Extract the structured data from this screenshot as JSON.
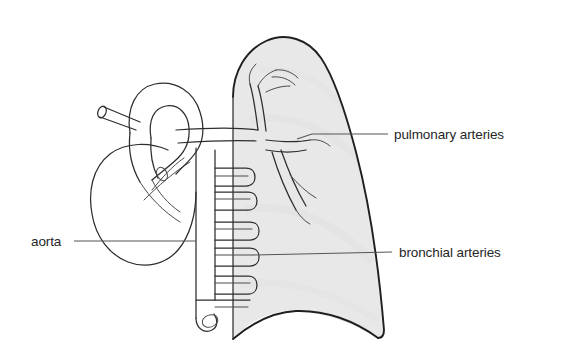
{
  "diagram": {
    "background_color": "#ffffff",
    "ink_color": "#2e2e2e",
    "lung_fill_color": "#e8e8e8",
    "labels": [
      {
        "id": "pulmonary-arteries",
        "text": "pulmonary arteries",
        "text_x": 394,
        "text_y": 139,
        "anchor": "start",
        "leader": "M 388 134 L 312 134 L 297 139",
        "side": "right"
      },
      {
        "id": "bronchial-arteries",
        "text": "bronchial arteries",
        "text_x": 399,
        "text_y": 257,
        "anchor": "start",
        "leader": "M 392 252 L 252 255",
        "side": "right"
      },
      {
        "id": "aorta",
        "text": "aorta",
        "text_x": 31,
        "text_y": 246,
        "anchor": "start",
        "leader": "M 74 241 L 196 241",
        "side": "left"
      }
    ],
    "structures": [
      {
        "id": "lung",
        "name": "lung"
      },
      {
        "id": "heart",
        "name": "heart"
      },
      {
        "id": "aortic-arch",
        "name": "aortic arch"
      },
      {
        "id": "descending-aorta",
        "name": "descending aorta"
      },
      {
        "id": "pulmonary-artery-tree",
        "name": "pulmonary artery tree"
      },
      {
        "id": "bronchial-artery-loops",
        "name": "bronchial artery loops"
      },
      {
        "id": "brachiocephalic-branch",
        "name": "brachiocephalic branch"
      }
    ]
  }
}
